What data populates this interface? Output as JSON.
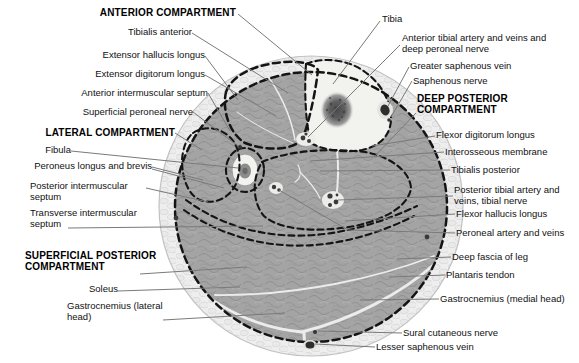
{
  "figure": {
    "kind": "cross-section",
    "compartment_headings": [
      "ANTERIOR COMPARTMENT",
      "LATERAL COMPARTMENT",
      "DEEP POSTERIOR COMPARTMENT",
      "SUPERFICIAL POSTERIOR COMPARTMENT"
    ]
  },
  "labels": {
    "left": [
      {
        "id": "anterior-compartment",
        "text": "ANTERIOR COMPARTMENT",
        "emphasis": "bold"
      },
      {
        "id": "tibialis-anterior",
        "text": "Tibialis anterior"
      },
      {
        "id": "extensor-hallucis-longus",
        "text": "Extensor hallucis longus"
      },
      {
        "id": "extensor-digitorum-longus",
        "text": "Extensor digitorum longus"
      },
      {
        "id": "anterior-intermuscular-septum",
        "text": "Anterior intermuscular septum"
      },
      {
        "id": "superficial-peroneal-nerve",
        "text": "Superficial peroneal nerve"
      },
      {
        "id": "lateral-compartment",
        "text": "LATERAL COMPARTMENT",
        "emphasis": "bold"
      },
      {
        "id": "fibula",
        "text": "Fibula"
      },
      {
        "id": "peroneus-longus-and-brevis",
        "text": "Peroneus longus and brevis"
      },
      {
        "id": "posterior-intermuscular-septum",
        "text": "Posterior intermuscular septum"
      },
      {
        "id": "transverse-intermuscular-septum",
        "text": "Transverse intermuscular septum"
      },
      {
        "id": "superficial-posterior-compartment",
        "text": "SUPERFICIAL POSTERIOR COMPARTMENT",
        "emphasis": "bold"
      },
      {
        "id": "soleus",
        "text": "Soleus"
      },
      {
        "id": "gastrocnemius-lateral-head",
        "text": "Gastrocnemius (lateral head)"
      }
    ],
    "right": [
      {
        "id": "tibia",
        "text": "Tibia"
      },
      {
        "id": "anterior-tibial-artery",
        "text": "Anterior tibial artery and veins and deep peroneal nerve"
      },
      {
        "id": "greater-saphenous-vein",
        "text": "Greater saphenous vein"
      },
      {
        "id": "saphenous-nerve",
        "text": "Saphenous nerve"
      },
      {
        "id": "deep-posterior-compartment",
        "text": "DEEP POSTERIOR COMPARTMENT",
        "emphasis": "bold"
      },
      {
        "id": "flexor-digitorum-longus",
        "text": "Flexor digitorum longus"
      },
      {
        "id": "interosseous-membrane",
        "text": "Interosseous membrane"
      },
      {
        "id": "tibialis-posterior",
        "text": "Tibialis posterior"
      },
      {
        "id": "posterior-tibial-artery",
        "text": "Posterior tibial artery and veins, tibial nerve"
      },
      {
        "id": "flexor-hallucis-longus",
        "text": "Flexor hallucis longus"
      },
      {
        "id": "peroneal-artery-and-veins",
        "text": "Peroneal artery and veins"
      },
      {
        "id": "deep-fascia-of-leg",
        "text": "Deep fascia of leg"
      },
      {
        "id": "plantaris-tendon",
        "text": "Plantaris tendon"
      },
      {
        "id": "gastrocnemius-medial-head",
        "text": "Gastrocnemius (medial head)"
      },
      {
        "id": "sural-cutaneous-nerve",
        "text": "Sural cutaneous nerve"
      },
      {
        "id": "lesser-saphenous-vein",
        "text": "Lesser saphenous vein"
      }
    ]
  },
  "colors": {
    "background": "#ffffff",
    "muscle": "#a4a4a4",
    "subcutaneous_fat": "#eeeeee",
    "bone": "#f2f2ef",
    "marrow_dark": "#4c4c4c",
    "compartment_dash": "#141414",
    "leader_line": "#7a7a7a",
    "text": "#111111"
  }
}
